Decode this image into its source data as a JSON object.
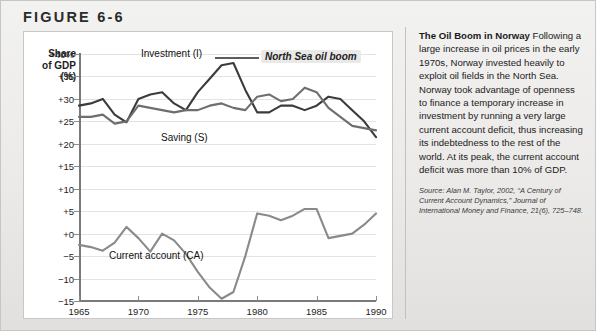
{
  "figure": {
    "header": "FIGURE 6-6"
  },
  "chart_data": {
    "type": "line",
    "title": "",
    "xlabel": "",
    "ylabel": "Share\nof GDP\n(%)",
    "ylabel_lines": [
      "Share",
      "of GDP",
      "(%)"
    ],
    "xlim": [
      1965,
      1990
    ],
    "ylim": [
      -15,
      40
    ],
    "grid": true,
    "legend": "inline-labels",
    "y_ticks": [
      "+40%",
      "+35",
      "+30",
      "+25",
      "+20",
      "+15",
      "+10",
      "+5",
      "+0",
      "-5",
      "-10",
      "-15"
    ],
    "y_tick_values": [
      40,
      35,
      30,
      25,
      20,
      15,
      10,
      5,
      0,
      -5,
      -10,
      -15
    ],
    "x_ticks": [
      "1965",
      "1970",
      "1975",
      "1980",
      "1985",
      "1990"
    ],
    "x_tick_values": [
      1965,
      1970,
      1975,
      1980,
      1985,
      1990
    ],
    "x": [
      1965,
      1966,
      1967,
      1968,
      1969,
      1970,
      1971,
      1972,
      1973,
      1974,
      1975,
      1976,
      1977,
      1978,
      1979,
      1980,
      1981,
      1982,
      1983,
      1984,
      1985,
      1986,
      1987,
      1988,
      1989,
      1990
    ],
    "series": [
      {
        "name": "Investment (I)",
        "label": "Investment (I)",
        "color": "#3b3b3b",
        "values": [
          28.5,
          29.0,
          30.0,
          26.5,
          24.8,
          30.0,
          31.0,
          31.5,
          29.0,
          27.5,
          31.5,
          34.5,
          37.5,
          38.0,
          32.0,
          27.0,
          27.0,
          28.5,
          28.5,
          27.5,
          28.5,
          30.5,
          30.0,
          27.5,
          25.0,
          21.5
        ]
      },
      {
        "name": "Saving (S)",
        "label": "Saving (S)",
        "color": "#6e6e6e",
        "values": [
          26.0,
          26.0,
          26.5,
          24.5,
          25.0,
          28.5,
          28.0,
          27.5,
          27.0,
          27.5,
          27.5,
          28.5,
          29.0,
          28.0,
          27.5,
          30.5,
          31.0,
          29.5,
          30.0,
          32.5,
          31.5,
          28.0,
          26.0,
          24.0,
          23.5,
          23.0
        ]
      },
      {
        "name": "Current account (CA)",
        "label": "Current account (CA)",
        "color": "#8a8a8a",
        "values": [
          -2.5,
          -3.0,
          -3.8,
          -2.0,
          1.5,
          -1.0,
          -4.0,
          0.0,
          -1.5,
          -4.5,
          -8.5,
          -12.0,
          -14.5,
          -13.0,
          -5.0,
          4.5,
          4.0,
          3.0,
          4.0,
          5.5,
          5.5,
          -1.0,
          -0.5,
          0.0,
          2.0,
          4.5
        ]
      }
    ],
    "annotations": [
      {
        "text": "North Sea oil boom",
        "style": "italic-callout",
        "x": 1978,
        "y": 40
      }
    ]
  },
  "sidebar": {
    "lead": "The Oil Boom in Norway",
    "body": " Following a large increase in oil prices in the early 1970s, Norway invested heavily to exploit oil fields in the North Sea. Norway took advantage of openness to finance a temporary increase in investment by running a very large current account deficit, thus increasing its indebtedness to the rest of the world. At its peak, the current account deficit was more than 10% of GDP.",
    "source": "Source: Alan M. Taylor, 2002, “A Century of Current Account Dynamics,” Journal of International Money and Finance, 21(6), 725–748."
  }
}
